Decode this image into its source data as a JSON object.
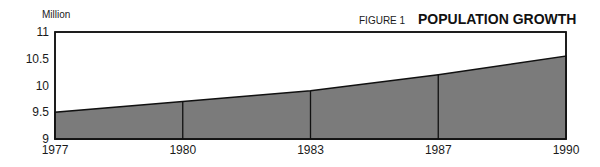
{
  "chart_data": {
    "type": "area",
    "figure_label": "FIGURE 1",
    "title": "POPULATION GROWTH",
    "ylabel": "Million",
    "xlabel": "",
    "categories": [
      "1977",
      "1980",
      "1983",
      "1987",
      "1990"
    ],
    "series": [
      {
        "name": "Population",
        "values": [
          9.5,
          9.7,
          9.9,
          10.2,
          10.55
        ]
      }
    ],
    "ylim": [
      9,
      11
    ],
    "yticks": [
      "9",
      "9.5",
      "10",
      "10.5",
      "11"
    ],
    "ytick_values": [
      9,
      9.5,
      10,
      10.5,
      11
    ],
    "grid": false,
    "legend": "none",
    "fill_color": "#7b7b7b",
    "line_color": "#111111"
  }
}
